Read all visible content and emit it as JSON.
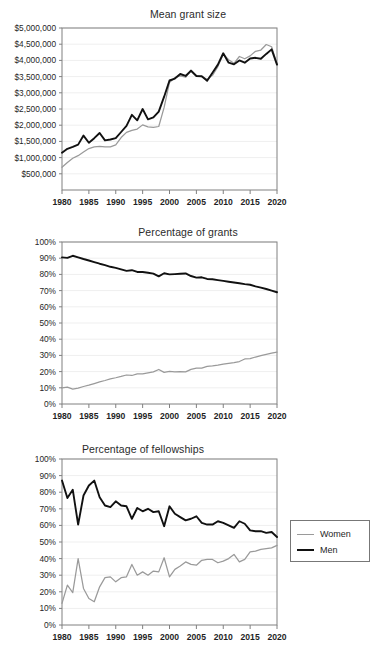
{
  "figure": {
    "legend": {
      "items": [
        {
          "label": "Women",
          "color": "#9a9a9a",
          "style": "thin-gray"
        },
        {
          "label": "Men",
          "color": "#111111",
          "style": "thick-black"
        }
      ]
    }
  },
  "chart_data": [
    {
      "type": "line",
      "title": "Mean grant size",
      "xlabel": "",
      "ylabel": "",
      "xlim": [
        1980,
        2020
      ],
      "ylim": [
        0,
        5000000
      ],
      "ytick_labels": [
        "$500,000",
        "$1,000,000",
        "$1,500,000",
        "$2,000,000",
        "$2,500,000",
        "$3,000,000",
        "$3,500,000",
        "$4,000,000",
        "$4,500,000",
        "$5,000,000"
      ],
      "ytick_values": [
        500000,
        1000000,
        1500000,
        2000000,
        2500000,
        3000000,
        3500000,
        4000000,
        4500000,
        5000000
      ],
      "xtick_labels": [
        "1980",
        "1985",
        "1990",
        "1995",
        "2000",
        "2005",
        "2010",
        "2015",
        "2020"
      ],
      "xtick_values": [
        1980,
        1985,
        1990,
        1995,
        2000,
        2005,
        2010,
        2015,
        2020
      ],
      "grid": true,
      "legend_position": "external-right",
      "x": [
        1980,
        1981,
        1982,
        1983,
        1984,
        1985,
        1986,
        1987,
        1988,
        1989,
        1990,
        1991,
        1992,
        1993,
        1994,
        1995,
        1996,
        1997,
        1998,
        1999,
        2000,
        2001,
        2002,
        2003,
        2004,
        2005,
        2006,
        2007,
        2008,
        2009,
        2010,
        2011,
        2012,
        2013,
        2014,
        2015,
        2016,
        2017,
        2018,
        2019,
        2020
      ],
      "series": [
        {
          "name": "Men",
          "color": "#111111",
          "values": [
            1150000,
            1270000,
            1330000,
            1400000,
            1680000,
            1460000,
            1600000,
            1760000,
            1530000,
            1560000,
            1600000,
            1790000,
            1980000,
            2320000,
            2150000,
            2500000,
            2180000,
            2240000,
            2420000,
            2880000,
            3380000,
            3440000,
            3580000,
            3520000,
            3680000,
            3520000,
            3510000,
            3370000,
            3620000,
            3870000,
            4220000,
            3930000,
            3880000,
            4000000,
            3930000,
            4060000,
            4080000,
            4050000,
            4200000,
            4340000,
            3870000
          ]
        },
        {
          "name": "Women",
          "color": "#9a9a9a",
          "values": [
            700000,
            850000,
            980000,
            1060000,
            1170000,
            1280000,
            1330000,
            1350000,
            1330000,
            1330000,
            1390000,
            1620000,
            1780000,
            1840000,
            1880000,
            2010000,
            1950000,
            1930000,
            1960000,
            2550000,
            3320000,
            3470000,
            3520000,
            3480000,
            3700000,
            3530000,
            3500000,
            3420000,
            3540000,
            3810000,
            4190000,
            4020000,
            3910000,
            4120000,
            4050000,
            4140000,
            4280000,
            4320000,
            4490000,
            4420000,
            3880000
          ]
        }
      ]
    },
    {
      "type": "line",
      "title": "Percentage of grants",
      "xlabel": "",
      "ylabel": "",
      "xlim": [
        1980,
        2020
      ],
      "ylim": [
        0,
        100
      ],
      "ytick_labels": [
        "0%",
        "10%",
        "20%",
        "30%",
        "40%",
        "50%",
        "60%",
        "70%",
        "80%",
        "90%",
        "100%"
      ],
      "ytick_values": [
        0,
        10,
        20,
        30,
        40,
        50,
        60,
        70,
        80,
        90,
        100
      ],
      "xtick_labels": [
        "1980",
        "1985",
        "1990",
        "1995",
        "2000",
        "2005",
        "2010",
        "2015",
        "2020"
      ],
      "xtick_values": [
        1980,
        1985,
        1990,
        1995,
        2000,
        2005,
        2010,
        2015,
        2020
      ],
      "grid": true,
      "legend_position": "external-right",
      "x": [
        1980,
        1981,
        1982,
        1983,
        1984,
        1985,
        1986,
        1987,
        1988,
        1989,
        1990,
        1991,
        1992,
        1993,
        1994,
        1995,
        1996,
        1997,
        1998,
        1999,
        2000,
        2001,
        2002,
        2003,
        2004,
        2005,
        2006,
        2007,
        2008,
        2009,
        2010,
        2011,
        2012,
        2013,
        2014,
        2015,
        2016,
        2017,
        2018,
        2019,
        2020
      ],
      "series": [
        {
          "name": "Men",
          "color": "#111111",
          "values": [
            90.5,
            90.2,
            91.5,
            90.5,
            89.5,
            88.6,
            87.6,
            86.6,
            85.7,
            84.7,
            84.0,
            83.1,
            82.2,
            82.6,
            81.5,
            81.5,
            81.0,
            80.5,
            78.8,
            80.7,
            80.0,
            80.2,
            80.4,
            80.6,
            79.0,
            78.0,
            78.2,
            77.2,
            77.0,
            76.5,
            76.0,
            75.5,
            75.0,
            74.5,
            74.0,
            73.6,
            72.6,
            71.8,
            71.0,
            70.0,
            69.0
          ]
        },
        {
          "name": "Women",
          "color": "#9a9a9a",
          "values": [
            10.0,
            10.4,
            9.2,
            9.8,
            10.8,
            11.6,
            12.6,
            13.6,
            14.5,
            15.5,
            16.2,
            17.0,
            17.9,
            17.6,
            18.6,
            18.6,
            19.2,
            19.8,
            21.3,
            19.5,
            20.2,
            19.9,
            20.0,
            19.8,
            21.4,
            22.2,
            22.2,
            23.2,
            23.5,
            24.0,
            24.6,
            25.1,
            25.6,
            26.2,
            27.8,
            28.0,
            29.0,
            29.8,
            30.6,
            31.4,
            32.0
          ]
        }
      ]
    },
    {
      "type": "line",
      "title": "Percentage of fellowships",
      "xlabel": "",
      "ylabel": "",
      "xlim": [
        1980,
        2020
      ],
      "ylim": [
        0,
        100
      ],
      "ytick_labels": [
        "0%",
        "10%",
        "20%",
        "30%",
        "40%",
        "50%",
        "60%",
        "70%",
        "80%",
        "90%",
        "100%"
      ],
      "ytick_values": [
        0,
        10,
        20,
        30,
        40,
        50,
        60,
        70,
        80,
        90,
        100
      ],
      "xtick_labels": [
        "1980",
        "1985",
        "1990",
        "1995",
        "2000",
        "2005",
        "2010",
        "2015",
        "2020"
      ],
      "xtick_values": [
        1980,
        1985,
        1990,
        1995,
        2000,
        2005,
        2010,
        2015,
        2020
      ],
      "grid": true,
      "legend_position": "external-right",
      "x": [
        1980,
        1981,
        1982,
        1983,
        1984,
        1985,
        1986,
        1987,
        1988,
        1989,
        1990,
        1991,
        1992,
        1993,
        1994,
        1995,
        1996,
        1997,
        1998,
        1999,
        2000,
        2001,
        2002,
        2003,
        2004,
        2005,
        2006,
        2007,
        2008,
        2009,
        2010,
        2011,
        2012,
        2013,
        2014,
        2015,
        2016,
        2017,
        2018,
        2019,
        2020
      ],
      "series": [
        {
          "name": "Men",
          "color": "#111111",
          "values": [
            87.0,
            76.5,
            81.5,
            60.5,
            78.0,
            84.0,
            87.0,
            77.0,
            72.0,
            71.0,
            74.5,
            72.0,
            71.5,
            64.0,
            70.5,
            68.5,
            70.0,
            68.0,
            68.5,
            59.5,
            71.5,
            67.0,
            65.0,
            63.0,
            64.0,
            65.5,
            61.5,
            60.5,
            60.5,
            62.5,
            61.5,
            60.0,
            58.5,
            62.5,
            61.0,
            57.0,
            56.5,
            56.5,
            55.5,
            56.0,
            53.0
          ]
        },
        {
          "name": "Women",
          "color": "#9a9a9a",
          "values": [
            13.0,
            24.0,
            19.5,
            40.0,
            22.0,
            16.0,
            14.0,
            23.0,
            28.5,
            29.0,
            26.0,
            28.5,
            29.0,
            36.5,
            30.0,
            32.0,
            30.0,
            32.5,
            32.0,
            40.5,
            29.0,
            33.5,
            35.5,
            38.0,
            36.5,
            36.0,
            39.0,
            39.5,
            39.5,
            37.5,
            38.5,
            40.0,
            42.5,
            38.0,
            39.5,
            44.0,
            44.5,
            45.5,
            46.0,
            46.5,
            48.0
          ]
        }
      ]
    }
  ]
}
